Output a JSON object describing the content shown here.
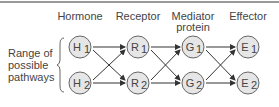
{
  "columns": [
    {
      "label": "Hormone",
      "label2": "",
      "x": 80
    },
    {
      "label": "Receptor",
      "label2": "",
      "x": 138
    },
    {
      "label": "Mediator",
      "label2": "protein",
      "x": 193
    },
    {
      "label": "Effector",
      "label2": "",
      "x": 248
    }
  ],
  "side_label": [
    "Range of",
    "possible",
    "pathways"
  ],
  "nodes": [
    {
      "id": "H1",
      "letter": "H",
      "sub": "1"
    },
    {
      "id": "H2",
      "letter": "H",
      "sub": "2"
    },
    {
      "id": "R1",
      "letter": "R",
      "sub": "1"
    },
    {
      "id": "R2",
      "letter": "R",
      "sub": "2"
    },
    {
      "id": "G1",
      "letter": "G",
      "sub": "1"
    },
    {
      "id": "G2",
      "letter": "G",
      "sub": "2"
    },
    {
      "id": "E1",
      "letter": "E",
      "sub": "1"
    },
    {
      "id": "E2",
      "letter": "E",
      "sub": "2"
    }
  ],
  "colors": {
    "node_fill": "#e6e6e6",
    "stroke": "#555555",
    "rule": "#777777"
  }
}
